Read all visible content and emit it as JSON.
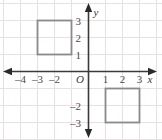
{
  "figure": {
    "colors": {
      "background": "#ffffff",
      "grid": "#e8e0e2",
      "axis": "#3a3a3a",
      "shape_stroke": "#8a8a8a",
      "label": "#4a4a4a"
    },
    "axes": {
      "x_label": "x",
      "y_label": "y",
      "origin_label": "O",
      "x_ticks": [
        {
          "value": -4,
          "label": "–4"
        },
        {
          "value": -3,
          "label": "–3"
        },
        {
          "value": -2,
          "label": "–2"
        },
        {
          "value": 1,
          "label": "1"
        },
        {
          "value": 2,
          "label": "2"
        },
        {
          "value": 3,
          "label": "3"
        }
      ],
      "y_ticks": [
        {
          "value": 3,
          "label": "3"
        },
        {
          "value": 2,
          "label": "2"
        },
        {
          "value": 1,
          "label": "1"
        },
        {
          "value": -2,
          "label": "–2"
        },
        {
          "value": -3,
          "label": "–3"
        }
      ],
      "x_range": [
        -4.8,
        4.2
      ],
      "y_range": [
        -4.1,
        4.2
      ]
    },
    "shapes": [
      {
        "name": "square-upper-left",
        "type": "square",
        "x_min": -3,
        "x_max": -1,
        "y_min": 1,
        "y_max": 3
      },
      {
        "name": "square-lower-right",
        "type": "square",
        "x_min": 1,
        "x_max": 3,
        "y_min": -3,
        "y_max": -1
      }
    ],
    "grid": {
      "visible": true,
      "spacing_units": 1
    }
  }
}
